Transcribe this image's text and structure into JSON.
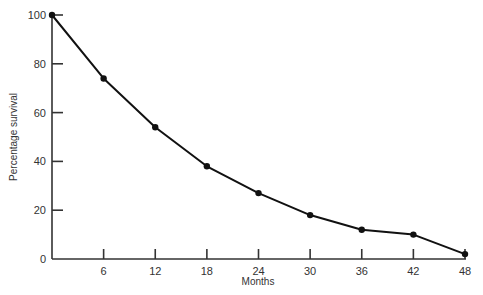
{
  "chart_data": {
    "type": "line",
    "title": "",
    "xlabel": "Months",
    "ylabel": "Percentage survival",
    "x": [
      0,
      6,
      12,
      18,
      24,
      30,
      36,
      42,
      48
    ],
    "series": [
      {
        "name": "Survival",
        "values": [
          100,
          74,
          54,
          38,
          27,
          18,
          12,
          10,
          2
        ]
      }
    ],
    "xticks": [
      6,
      12,
      18,
      24,
      30,
      36,
      42,
      48
    ],
    "yticks": [
      0,
      20,
      40,
      60,
      80,
      100
    ],
    "xlim": [
      0,
      48
    ],
    "ylim": [
      0,
      100
    ],
    "grid": false,
    "legend": "none",
    "line_color": "#111111",
    "marker": "filled-circle"
  }
}
